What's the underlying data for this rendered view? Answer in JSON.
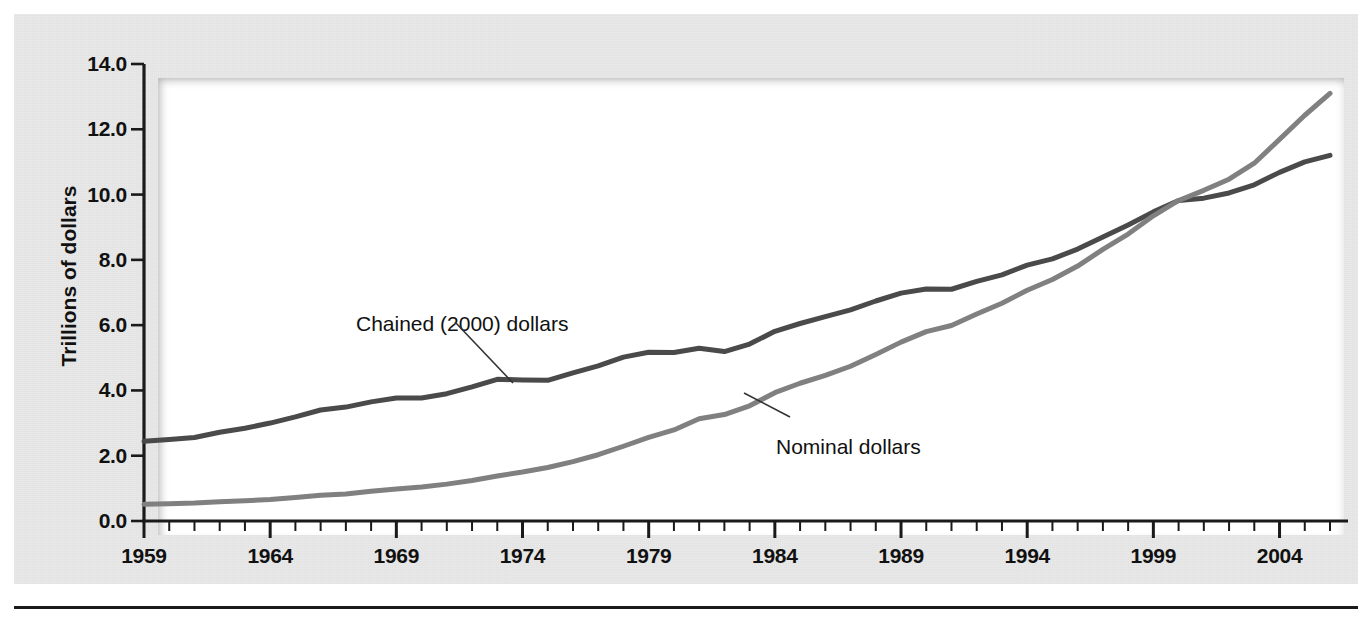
{
  "figure": {
    "background_color": "#e9e9e9",
    "plot_background_color": "#ffffff",
    "axis_color": "#1a1a1a",
    "bottom_rule_color": "#1a1a1a"
  },
  "axes": {
    "y_title": "Trillions of dollars",
    "y_ticks": [
      "14.0",
      "12.0",
      "10.0",
      "8.0",
      "6.0",
      "4.0",
      "2.0",
      "0.0"
    ],
    "x_ticks": [
      "1959",
      "1964",
      "1969",
      "1974",
      "1979",
      "1984",
      "1989",
      "1994",
      "1999",
      "2004"
    ]
  },
  "annotations": {
    "chained": "Chained (2000) dollars",
    "nominal": "Nominal dollars"
  },
  "chart_data": {
    "type": "line",
    "title": "",
    "subtitle": "",
    "xlabel": "",
    "ylabel": "Trillions of dollars",
    "xlim": [
      1959,
      2006
    ],
    "ylim": [
      0.0,
      14.0
    ],
    "ytick_values": [
      0.0,
      2.0,
      4.0,
      6.0,
      8.0,
      10.0,
      12.0,
      14.0
    ],
    "xtick_values": [
      1959,
      1964,
      1969,
      1974,
      1979,
      1984,
      1989,
      1994,
      1999,
      2004
    ],
    "x_minor_tick_interval": 1,
    "grid": false,
    "legend": "annotated-inline",
    "x": [
      1959,
      1960,
      1961,
      1962,
      1963,
      1964,
      1965,
      1966,
      1967,
      1968,
      1969,
      1970,
      1971,
      1972,
      1973,
      1974,
      1975,
      1976,
      1977,
      1978,
      1979,
      1980,
      1981,
      1982,
      1983,
      1984,
      1985,
      1986,
      1987,
      1988,
      1989,
      1990,
      1991,
      1992,
      1993,
      1994,
      1995,
      1996,
      1997,
      1998,
      1999,
      2000,
      2001,
      2002,
      2003,
      2004,
      2005,
      2006
    ],
    "series": [
      {
        "name": "Chained (2000) dollars",
        "color": "#4a4a4a",
        "line_width": 5,
        "values": [
          2.44,
          2.5,
          2.56,
          2.72,
          2.84,
          3.0,
          3.19,
          3.4,
          3.49,
          3.65,
          3.77,
          3.77,
          3.9,
          4.11,
          4.34,
          4.32,
          4.31,
          4.54,
          4.75,
          5.02,
          5.17,
          5.16,
          5.29,
          5.19,
          5.42,
          5.81,
          6.05,
          6.26,
          6.47,
          6.74,
          6.98,
          7.11,
          7.1,
          7.34,
          7.54,
          7.84,
          8.03,
          8.33,
          8.7,
          9.07,
          9.47,
          9.82,
          9.89,
          10.05,
          10.3,
          10.68,
          11.0,
          11.2
        ]
      },
      {
        "name": "Nominal dollars",
        "color": "#808080",
        "line_width": 5,
        "values": [
          0.51,
          0.53,
          0.55,
          0.59,
          0.62,
          0.66,
          0.72,
          0.79,
          0.83,
          0.91,
          0.98,
          1.04,
          1.13,
          1.24,
          1.38,
          1.5,
          1.64,
          1.82,
          2.03,
          2.29,
          2.56,
          2.79,
          3.13,
          3.26,
          3.53,
          3.93,
          4.22,
          4.46,
          4.74,
          5.1,
          5.48,
          5.8,
          5.99,
          6.34,
          6.67,
          7.07,
          7.4,
          7.81,
          8.32,
          8.79,
          9.35,
          9.82,
          10.13,
          10.47,
          10.96,
          11.69,
          12.43,
          13.1
        ]
      }
    ]
  }
}
